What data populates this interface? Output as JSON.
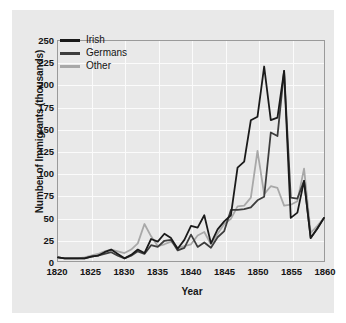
{
  "chart_data": {
    "type": "line",
    "title": "",
    "xlabel": "Year",
    "ylabel": "Number of Immigrants (thousands)",
    "xlim": [
      1820,
      1860
    ],
    "ylim": [
      0,
      250
    ],
    "xticks": [
      "1820",
      "1825",
      "1830",
      "1835",
      "1840",
      "1845",
      "1850",
      "1855",
      "1860"
    ],
    "yticks": [
      "0",
      "25",
      "50",
      "75",
      "100",
      "125",
      "150",
      "175",
      "200",
      "225",
      "250"
    ],
    "grid": true,
    "legend_position": "upper-left",
    "x": [
      1820,
      1821,
      1822,
      1823,
      1824,
      1825,
      1826,
      1827,
      1828,
      1829,
      1830,
      1831,
      1832,
      1833,
      1834,
      1835,
      1836,
      1837,
      1838,
      1839,
      1840,
      1841,
      1842,
      1843,
      1844,
      1845,
      1846,
      1847,
      1848,
      1849,
      1850,
      1851,
      1852,
      1853,
      1854,
      1855,
      1856,
      1857,
      1858,
      1859,
      1860
    ],
    "series": [
      {
        "name": "Irish",
        "color": "#1a1a1a",
        "values": [
          4,
          3,
          3,
          3,
          3,
          5,
          6,
          10,
          13,
          8,
          3,
          7,
          13,
          9,
          25,
          22,
          31,
          26,
          14,
          24,
          40,
          38,
          52,
          20,
          36,
          45,
          52,
          106,
          113,
          160,
          164,
          221,
          160,
          163,
          216,
          49,
          55,
          91,
          26,
          37,
          49
        ]
      },
      {
        "name": "Germans",
        "color": "#3d3d3d",
        "values": [
          4,
          3,
          3,
          3,
          3,
          5,
          6,
          8,
          10,
          6,
          3,
          6,
          11,
          8,
          18,
          16,
          23,
          24,
          12,
          15,
          30,
          16,
          21,
          15,
          27,
          34,
          58,
          58,
          59,
          61,
          69,
          73,
          146,
          142,
          216,
          72,
          71,
          91,
          26,
          37,
          49
        ]
      },
      {
        "name": "Other",
        "color": "#a8a8a8",
        "values": [
          4,
          3,
          3,
          3,
          4,
          6,
          8,
          11,
          13,
          11,
          9,
          13,
          20,
          42,
          28,
          17,
          19,
          22,
          15,
          17,
          19,
          29,
          33,
          19,
          31,
          42,
          48,
          62,
          63,
          72,
          125,
          76,
          85,
          83,
          63,
          64,
          68,
          105,
          32,
          40,
          49
        ]
      }
    ]
  },
  "legend": {
    "items": [
      {
        "label": "Irish",
        "color": "#1a1a1a"
      },
      {
        "label": "Germans",
        "color": "#3d3d3d"
      },
      {
        "label": "Other",
        "color": "#a8a8a8"
      }
    ]
  }
}
